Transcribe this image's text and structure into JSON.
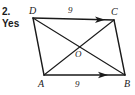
{
  "exercise": {
    "number": "2.",
    "answer": "Yes"
  },
  "figure": {
    "type": "parallelogram-with-diagonals",
    "stroke_color": "#1a1a1a",
    "background_color": "#ffffff",
    "vertices": [
      {
        "name": "D",
        "label": "D",
        "x": 33,
        "y": 18
      },
      {
        "name": "C",
        "label": "C",
        "x": 114,
        "y": 20
      },
      {
        "name": "B",
        "label": "B",
        "x": 125,
        "y": 75
      },
      {
        "name": "A",
        "label": "A",
        "x": 44,
        "y": 75
      }
    ],
    "intersection": {
      "name": "O",
      "label": "O",
      "x": 79,
      "y": 47
    },
    "sides": [
      {
        "name": "DC",
        "from": "D",
        "to": "C",
        "measure": "9",
        "has_arrow": true
      },
      {
        "name": "CB",
        "from": "C",
        "to": "B",
        "measure": "",
        "has_arrow": false
      },
      {
        "name": "AB",
        "from": "A",
        "to": "B",
        "measure": "9",
        "has_arrow": true
      },
      {
        "name": "DA",
        "from": "D",
        "to": "A",
        "measure": "",
        "has_arrow": false
      }
    ],
    "diagonals": [
      {
        "name": "DB",
        "from": "D",
        "to": "B"
      },
      {
        "name": "AC",
        "from": "A",
        "to": "C"
      }
    ]
  }
}
